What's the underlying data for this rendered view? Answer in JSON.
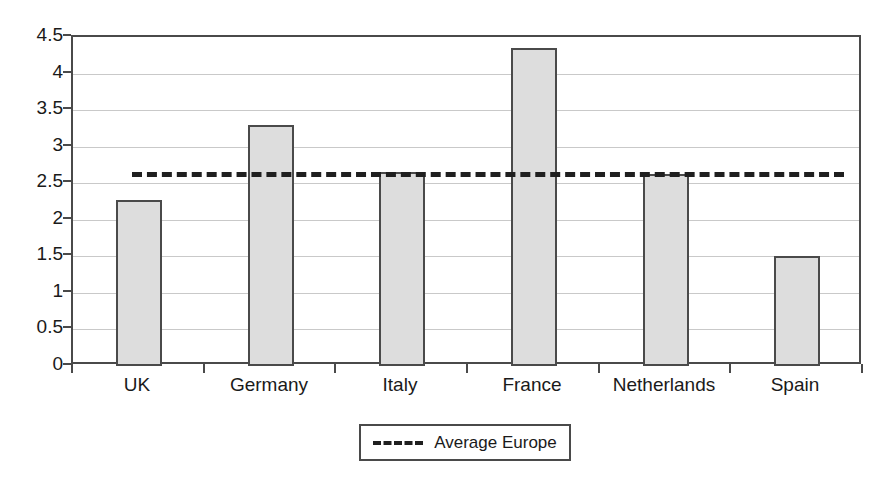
{
  "chart_data": {
    "type": "bar",
    "title": "",
    "subtitle": "",
    "xlabel": "",
    "ylabel": "",
    "categories": [
      "UK",
      "Germany",
      "Italy",
      "France",
      "Netherlands",
      "Spain"
    ],
    "values": [
      2.27,
      3.3,
      2.65,
      4.35,
      2.63,
      1.5
    ],
    "series": [
      {
        "name": "Country value",
        "type": "bar",
        "values": [
          2.27,
          3.3,
          2.65,
          4.35,
          2.63,
          1.5
        ]
      },
      {
        "name": "Average Europe",
        "type": "line",
        "style": "dashed",
        "value": 2.65
      }
    ],
    "ylim": [
      0,
      4.5
    ],
    "ytick_labels": [
      "0",
      "0.5",
      "1",
      "1.5",
      "2",
      "2.5",
      "3",
      "3.5",
      "4",
      "4.5"
    ],
    "ytick_values": [
      0,
      0.5,
      1,
      1.5,
      2,
      2.5,
      3,
      3.5,
      4,
      4.5
    ],
    "grid": true,
    "grid_axis": "y",
    "legend": {
      "position": "bottom-center",
      "entries": [
        {
          "label": "Average Europe",
          "marker": "dashed-line"
        }
      ]
    },
    "annotations": [
      {
        "label": "Average Europe",
        "type": "hline",
        "y": 2.65
      }
    ]
  },
  "colors": {
    "bar_fill": "#dddddd",
    "bar_stroke": "#4a4a4a",
    "axis": "#4a4a4a",
    "gridline": "#c9c9c9",
    "average_line": "#1f1f1f",
    "text": "#1a1a1a",
    "background": "#ffffff"
  }
}
